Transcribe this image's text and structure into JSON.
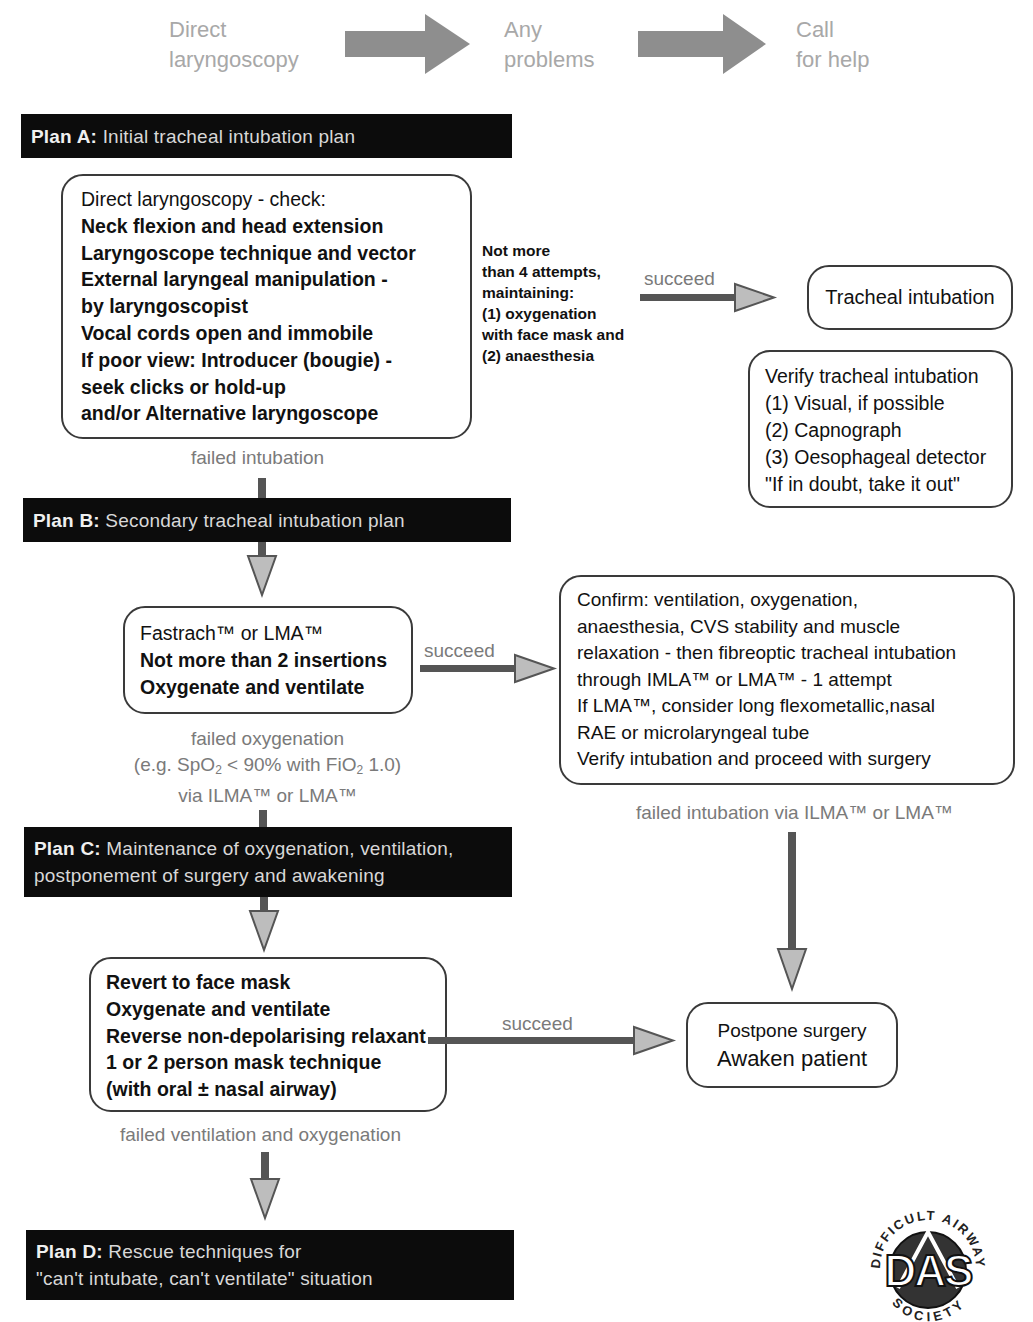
{
  "header_steps": [
    {
      "line1": "Direct",
      "line2": "laryngoscopy"
    },
    {
      "line1": "Any",
      "line2": "problems"
    },
    {
      "line1": "Call",
      "line2": "for help"
    }
  ],
  "plans": {
    "a": {
      "label": "Plan A:",
      "text": "Initial tracheal intubation plan"
    },
    "b": {
      "label": "Plan B:",
      "text": "Secondary tracheal intubation plan"
    },
    "c": {
      "label": "Plan C:",
      "text_line1": "Maintenance of oxygenation, ventilation,",
      "text_line2": "postponement of surgery and awakening"
    },
    "d": {
      "label": "Plan D:",
      "text_line1": "Rescue techniques for",
      "text_line2": "\"can't intubate, can't ventilate\" situation"
    }
  },
  "boxes": {
    "direct_laryngoscopy": [
      "Direct laryngoscopy - check:",
      "Neck flexion and head extension",
      "Laryngoscope technique and vector",
      "External laryngeal manipulation -",
      "by laryngoscopist",
      "Vocal cords open and immobile",
      "If poor view: Introducer (bougie) -",
      "seek clicks or hold-up",
      "and/or Alternative laryngoscope"
    ],
    "attempts_note": [
      "Not more",
      "than 4 attempts,",
      "maintaining:",
      "(1) oxygenation",
      "with face mask and",
      "(2) anaesthesia"
    ],
    "tracheal_intubation": "Tracheal intubation",
    "verify_intubation": [
      "Verify tracheal intubation",
      "(1) Visual, if possible",
      "(2) Capnograph",
      "(3) Oesophageal detector",
      "\"If in doubt, take it out\""
    ],
    "fastrach": [
      "Fastrach™ or LMA™",
      "Not more than 2 insertions",
      "Oxygenate and ventilate"
    ],
    "confirm": [
      "Confirm: ventilation, oxygenation,",
      "anaesthesia, CVS stability and muscle",
      "relaxation - then fibreoptic tracheal intubation",
      "through IMLA™ or LMA™ - 1 attempt",
      "If LMA™, consider long flexometallic,nasal",
      "RAE or microlaryngeal tube",
      "Verify intubation and proceed with surgery"
    ],
    "revert_face_mask": [
      "Revert to face mask",
      "Oxygenate and ventilate",
      "Reverse non-depolarising relaxant",
      "1 or 2 person mask technique",
      "(with oral ± nasal airway)"
    ],
    "postpone": [
      "Postpone surgery",
      "Awaken patient"
    ]
  },
  "edge_labels": {
    "succeed_a": "succeed",
    "succeed_b": "succeed",
    "succeed_c": "succeed",
    "failed_intubation": "failed intubation",
    "failed_oxygenation": {
      "line1": "failed oxygenation",
      "line2_pre": "(e.g. SpO",
      "line2_sub1": "2",
      "line2_mid": " < 90% with FiO",
      "line2_sub2": "2",
      "line2_post": " 1.0)",
      "line3": "via ILMA™ or LMA™"
    },
    "failed_intubation_ilma": "failed intubation via ILMA™ or LMA™",
    "failed_ventilation": "failed ventilation and oxygenation"
  },
  "logo": {
    "initials": "DAS",
    "ring_text_top": "DIFFICULT AIRWAY",
    "ring_text_bottom": "SOCIETY"
  },
  "colors": {
    "plan_bar_bg": "#0c0c0c",
    "arrow_shaft": "#555555",
    "arrow_head": "#b8b8b8",
    "header_arrow": "#8c8c8c",
    "muted_text": "#7a7a7a"
  }
}
